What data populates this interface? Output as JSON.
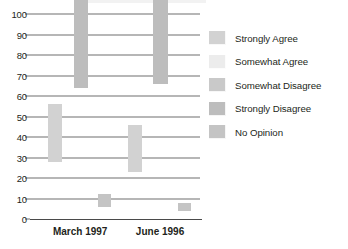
{
  "chart_data": {
    "type": "bar",
    "title": "",
    "subtitle": "",
    "xlabel": "",
    "ylabel": "",
    "ylim": [
      0,
      100
    ],
    "yticks": [
      0,
      10,
      20,
      30,
      40,
      50,
      60,
      70,
      80,
      90,
      100
    ],
    "ytick_labels": [
      "0",
      "10",
      "20",
      "30",
      "40",
      "50",
      "60",
      "70",
      "80",
      "90",
      "100"
    ],
    "grid": true,
    "legend_position": "right",
    "categories": [
      "March 1997",
      "June 1996"
    ],
    "series": [
      {
        "name": "Strongly Agree",
        "values": [
          28,
          23
        ],
        "color": "#d2d2d2"
      },
      {
        "name": "Somewhat Agree",
        "values": [
          6,
          11
        ],
        "color": "#ececec"
      },
      {
        "name": "Somewhat Disagree",
        "values": [
          0,
          0
        ],
        "color": "#c9c9c9"
      },
      {
        "name": "Strongly Disagree",
        "values": [
          64,
          66
        ],
        "color": "#bdbdbd"
      },
      {
        "name": "No Opinion",
        "values": [
          6,
          4
        ],
        "color": "#c4c4c4"
      }
    ],
    "bars": [
      {
        "group": "March 1997",
        "name": "agree-stack",
        "total": 34,
        "x_pct": 14.5,
        "width_pct": 8.2,
        "segments": [
          {
            "series": "Somewhat Agree",
            "from": 0,
            "to": 6,
            "color": "#ececec"
          },
          {
            "series": "Strongly Agree",
            "from": 6,
            "to": 34,
            "color": "#d2d2d2"
          }
        ]
      },
      {
        "group": "March 1997",
        "name": "strongly-disagree",
        "total": 64,
        "x_pct": 30.0,
        "width_pct": 8.8,
        "segments": [
          {
            "series": "Strongly Disagree",
            "from": 0,
            "to": 64,
            "color": "#bdbdbd"
          }
        ]
      },
      {
        "group": "March 1997",
        "name": "no-opinion",
        "total": 6,
        "x_pct": 44.0,
        "width_pct": 7.6,
        "segments": [
          {
            "series": "No Opinion",
            "from": 0,
            "to": 6,
            "color": "#c4c4c4"
          }
        ]
      },
      {
        "group": "June 1996",
        "name": "agree-stack",
        "total": 34,
        "x_pct": 61.5,
        "width_pct": 8.2,
        "segments": [
          {
            "series": "Somewhat Agree",
            "from": 0,
            "to": 11,
            "color": "#ececec"
          },
          {
            "series": "Strongly Agree",
            "from": 11,
            "to": 34,
            "color": "#d2d2d2"
          }
        ]
      },
      {
        "group": "June 1996",
        "name": "strongly-disagree",
        "total": 66,
        "x_pct": 77.0,
        "width_pct": 8.8,
        "segments": [
          {
            "series": "Strongly Disagree",
            "from": 0,
            "to": 66,
            "color": "#bdbdbd"
          }
        ]
      },
      {
        "group": "June 1996",
        "name": "no-opinion",
        "total": 4,
        "x_pct": 91.0,
        "width_pct": 7.6,
        "segments": [
          {
            "series": "No Opinion",
            "from": 0,
            "to": 4,
            "color": "#c4c4c4"
          }
        ]
      }
    ]
  },
  "legend": {
    "items": [
      {
        "label": "Strongly Agree",
        "color": "#d2d2d2"
      },
      {
        "label": "Somewhat Agree",
        "color": "#ececec"
      },
      {
        "label": "Somewhat Disagree",
        "color": "#c9c9c9"
      },
      {
        "label": "Strongly Disagree",
        "color": "#bdbdbd"
      },
      {
        "label": "No Opinion",
        "color": "#c4c4c4"
      }
    ]
  },
  "colors": {
    "background": "#ffffff",
    "gridline": "#6f6f6f",
    "axis": "#4a4a4a",
    "text": "#231f20"
  }
}
